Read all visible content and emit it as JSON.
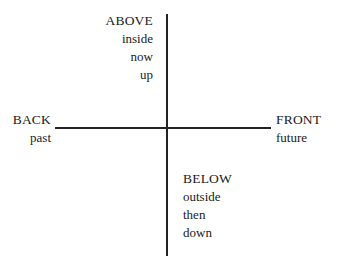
{
  "diagram": {
    "type": "quadrant-axes",
    "axes": {
      "vertical": {
        "top_label": "ABOVE",
        "bottom_label": "BELOW"
      },
      "horizontal": {
        "left_label": "BACK",
        "right_label": "FRONT"
      }
    },
    "above": {
      "title": "ABOVE",
      "lines": [
        "inside",
        "now",
        "up"
      ]
    },
    "back": {
      "title": "BACK",
      "lines": [
        "past"
      ]
    },
    "front": {
      "title": "FRONT",
      "lines": [
        "future"
      ]
    },
    "below": {
      "title": "BELOW",
      "lines": [
        "outside",
        "then",
        "down"
      ]
    },
    "colors": {
      "line": "#222222",
      "text": "#1a1a1a",
      "background": "#ffffff"
    }
  }
}
